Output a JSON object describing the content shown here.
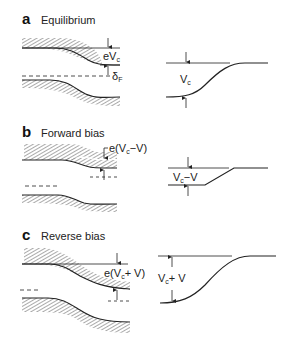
{
  "figure": {
    "panels": [
      {
        "letter": "a",
        "title": "Equilibrium",
        "band_label": "eV",
        "band_label_sub": "c",
        "fermi_label": "δ",
        "fermi_label_sub": "F",
        "potential_label": "V",
        "potential_label_sub": "c",
        "potential_label_suffix": ""
      },
      {
        "letter": "b",
        "title": "Forward bias",
        "band_label": "e(V",
        "band_label_sub": "c",
        "band_label_suffix": "−V)",
        "potential_label": "V",
        "potential_label_sub": "c",
        "potential_label_suffix": "−V"
      },
      {
        "letter": "c",
        "title": "Reverse bias",
        "band_label": "e(V",
        "band_label_sub": "c",
        "band_label_suffix": "+ V)",
        "potential_label": "V",
        "potential_label_sub": "c",
        "potential_label_suffix": "+ V"
      }
    ],
    "colors": {
      "line": "#222222",
      "hatch": "#555555",
      "background": "#ffffff"
    }
  }
}
